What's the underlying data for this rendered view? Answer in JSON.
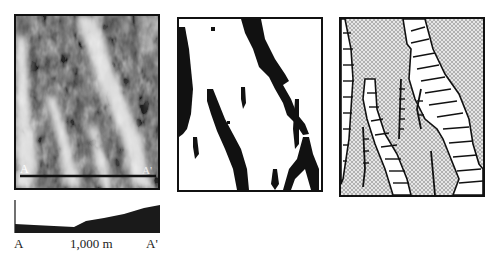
{
  "figure": {
    "panels": [
      {
        "id": "grayscale-image",
        "description": "grayscale raster image with section line",
        "section_start_label": "A",
        "section_end_label": "A'"
      },
      {
        "id": "binary-map",
        "description": "thresholded black-and-white map"
      },
      {
        "id": "interpretation-map",
        "description": "stippled interpretive sketch with hachured ridges"
      }
    ],
    "profile": {
      "start_label": "A",
      "scale_label": "1,000 m",
      "end_label": "A'"
    }
  }
}
